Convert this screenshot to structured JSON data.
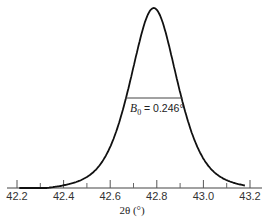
{
  "chart_data": {
    "type": "line",
    "title": "",
    "xlabel": "2θ (°)",
    "ylabel": "",
    "xlim": [
      42.2,
      43.2
    ],
    "x_ticks_major": [
      42.2,
      42.4,
      42.6,
      42.8,
      43.0,
      43.2
    ],
    "x_tick_labels": [
      "42.2",
      "42.4",
      "42.6",
      "42.8",
      "43.0",
      "43.2"
    ],
    "x_ticks_minor": [
      42.3,
      42.5,
      42.7,
      42.9,
      43.1
    ],
    "grid": false,
    "legend": null,
    "peak": {
      "center": 42.787,
      "fwhm": 0.246,
      "relative_height": 1.0
    },
    "annotation": {
      "text_symbol": "B",
      "text_subscript": "0",
      "text_value": "= 0.246°",
      "fwhm_line_x": [
        42.664,
        42.91
      ],
      "fwhm_line_y": 0.5
    },
    "series": [
      {
        "name": "diffraction peak",
        "x": [
          42.2,
          42.3,
          42.4,
          42.5,
          42.6,
          42.65,
          42.7,
          42.74,
          42.787,
          42.83,
          42.87,
          42.92,
          43.0,
          43.1,
          43.18
        ],
        "y": [
          0.0,
          0.03,
          0.07,
          0.14,
          0.27,
          0.4,
          0.62,
          0.86,
          1.0,
          0.86,
          0.64,
          0.46,
          0.22,
          0.05,
          0.0
        ]
      }
    ]
  }
}
